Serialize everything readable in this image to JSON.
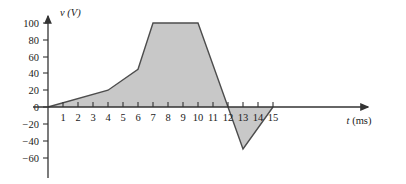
{
  "chart_data": {
    "type": "line",
    "title": "",
    "subtitle": "",
    "xlabel": "t (ms)",
    "ylabel": "v (V)",
    "x_axis_variable": "t",
    "x_axis_unit": "(ms)",
    "y_axis_variable": "v",
    "y_axis_unit": "(V)",
    "xlim": [
      0,
      17
    ],
    "ylim": [
      -70,
      110
    ],
    "grid": false,
    "legend": false,
    "filled": true,
    "fill_color": "#c8c8c8",
    "line_color": "#4d4d4d",
    "axis_color": "#333333",
    "xticks": [
      1,
      2,
      3,
      4,
      5,
      6,
      7,
      8,
      9,
      10,
      11,
      12,
      13,
      14,
      15
    ],
    "xtick_labels": [
      "1",
      "2",
      "3",
      "4",
      "5",
      "6",
      "7",
      "8",
      "9",
      "10",
      "11",
      "12",
      "13",
      "14",
      "15"
    ],
    "yticks": [
      100,
      80,
      60,
      40,
      20,
      0,
      -20,
      -40,
      -60
    ],
    "ytick_labels": [
      "100",
      "80",
      "60",
      "40",
      "20",
      "0",
      "−20",
      "−40",
      "−60"
    ],
    "x": [
      0,
      4,
      6,
      7,
      10,
      12,
      13,
      15
    ],
    "values": [
      0,
      20,
      45,
      100,
      100,
      0,
      -50,
      0
    ],
    "points": [
      {
        "t": 0,
        "v": 0
      },
      {
        "t": 4,
        "v": 20
      },
      {
        "t": 6,
        "v": 45
      },
      {
        "t": 7,
        "v": 100
      },
      {
        "t": 10,
        "v": 100
      },
      {
        "t": 12,
        "v": 0
      },
      {
        "t": 13,
        "v": -50
      },
      {
        "t": 15,
        "v": 0
      }
    ],
    "series": [
      {
        "name": "v(t)",
        "x": [
          0,
          4,
          6,
          7,
          10,
          12,
          13,
          15
        ],
        "values": [
          0,
          20,
          45,
          100,
          100,
          0,
          -50,
          0
        ]
      }
    ]
  }
}
